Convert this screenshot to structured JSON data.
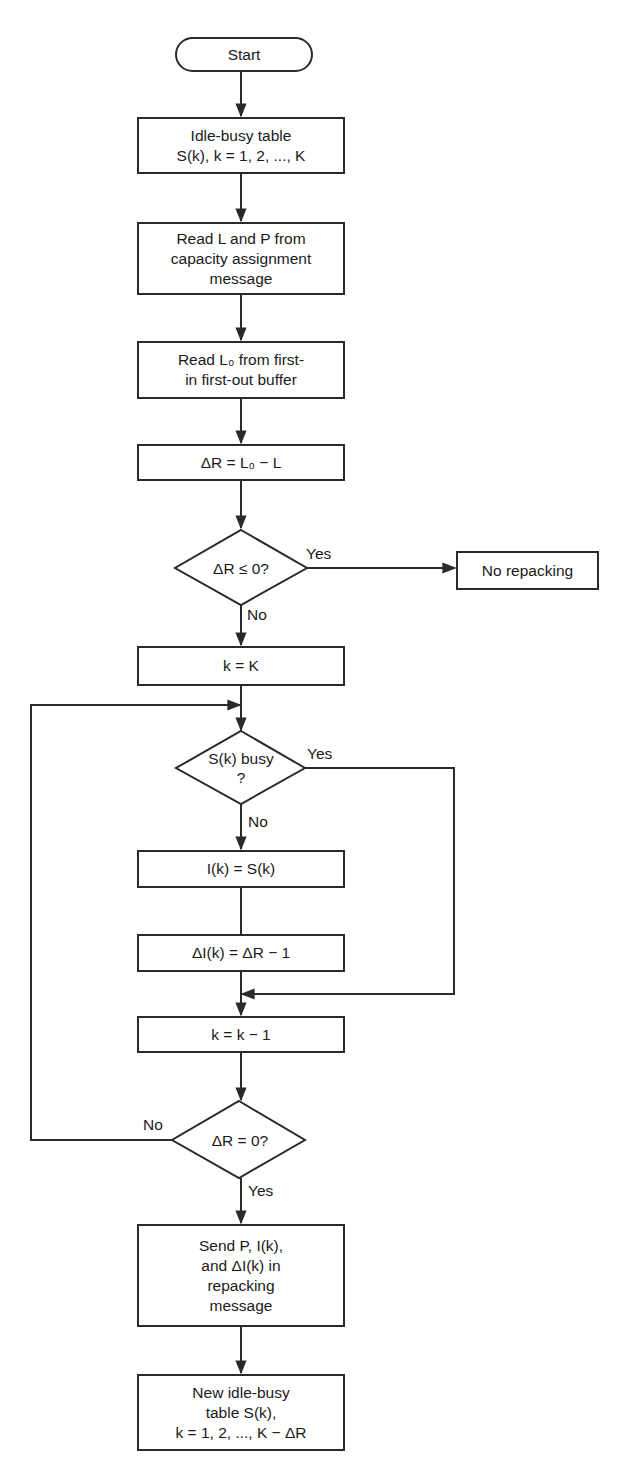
{
  "flowchart": {
    "start": {
      "label": "Start"
    },
    "idle_busy_table": {
      "label": "Idle-busy table\nS(k), k = 1, 2, ..., K"
    },
    "read_l_p": {
      "label": "Read L and P from\ncapacity assignment\nmessage"
    },
    "read_l0": {
      "label": "Read L₀ from first-\nin first-out buffer"
    },
    "delta_r": {
      "label": "ΔR = L₀ − L"
    },
    "decision_delta_r_le_0": {
      "label": "ΔR ≤ 0?",
      "yes": "Yes",
      "no": "No"
    },
    "no_repacking": {
      "label": "No repacking"
    },
    "k_equals_K": {
      "label": "k = K"
    },
    "decision_sk_busy": {
      "label": "S(k) busy\n?",
      "yes": "Yes",
      "no": "No"
    },
    "i_equals_s": {
      "label": "I(k) = S(k)"
    },
    "delta_i": {
      "label": "ΔI(k) = ΔR − 1"
    },
    "k_decrement": {
      "label": "k = k − 1"
    },
    "decision_delta_r_eq_0": {
      "label": "ΔR = 0?",
      "yes": "Yes",
      "no": "No"
    },
    "send_message": {
      "label": "Send P, I(k),\nand ΔI(k) in\nrepacking\nmessage"
    },
    "new_table": {
      "label": "New idle-busy\ntable S(k),\nk = 1, 2, ..., K − ΔR"
    }
  },
  "colors": {
    "line": "#2a2a2a",
    "background": "#ffffff",
    "text": "#1a1a1a"
  }
}
